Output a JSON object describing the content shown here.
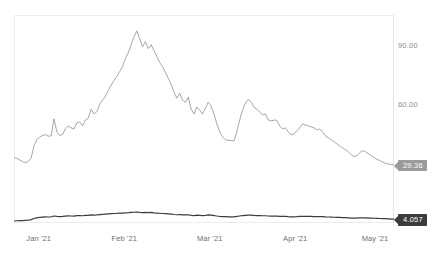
{
  "chart_data": {
    "type": "line",
    "title": "",
    "subtitle": "",
    "xlabel": "",
    "ylabel": "",
    "grid": false,
    "legend_position": "none",
    "x_tick_labels": [
      "Jan '21",
      "Feb '21",
      "Mar '21",
      "Apr '21",
      "May '21"
    ],
    "x_tick_positions_pct": [
      6.5,
      29.0,
      51.5,
      74.0,
      95.0
    ],
    "y_tick_labels": [
      "90.00",
      "60.00",
      "30.00"
    ],
    "y_tick_values": [
      90,
      60,
      30
    ],
    "ylim": [
      0,
      105
    ],
    "xlim_labels": [
      "2020-12-28",
      "2021-05-07"
    ],
    "series": [
      {
        "name": "primary-gray-series",
        "color": "#a6a6a6",
        "end_label": "29.36",
        "end_value": 29.36,
        "values": [
          33.0,
          32.6,
          31.8,
          31.0,
          30.4,
          31.2,
          32.8,
          39.0,
          42.0,
          43.5,
          44.2,
          44.6,
          43.8,
          44.0,
          52.6,
          46.0,
          44.2,
          44.8,
          47.5,
          49.0,
          48.0,
          47.4,
          50.6,
          51.0,
          49.0,
          52.0,
          53.0,
          57.5,
          55.0,
          56.2,
          60.0,
          62.0,
          64.0,
          67.0,
          69.5,
          72.0,
          74.0,
          76.5,
          79.0,
          83.0,
          86.0,
          90.0,
          94.0,
          97.0,
          93.0,
          89.0,
          91.5,
          88.0,
          90.0,
          87.0,
          84.0,
          81.0,
          79.0,
          76.0,
          73.0,
          70.0,
          66.0,
          63.0,
          65.5,
          62.0,
          61.0,
          63.5,
          57.5,
          55.0,
          58.5,
          57.0,
          55.0,
          58.0,
          61.0,
          59.0,
          55.0,
          50.0,
          46.0,
          43.5,
          42.0,
          41.8,
          41.6,
          41.5,
          46.0,
          52.0,
          57.0,
          60.5,
          62.5,
          61.0,
          58.5,
          57.5,
          56.0,
          54.5,
          55.0,
          52.0,
          51.5,
          52.0,
          51.8,
          49.0,
          47.5,
          48.0,
          46.0,
          44.5,
          45.0,
          46.5,
          48.0,
          50.0,
          49.5,
          49.0,
          48.5,
          48.0,
          47.0,
          47.5,
          46.0,
          44.0,
          43.0,
          42.0,
          41.0,
          40.0,
          39.0,
          38.0,
          37.0,
          36.0,
          34.5,
          33.5,
          34.0,
          35.5,
          36.5,
          36.0,
          35.0,
          34.0,
          33.0,
          32.2,
          31.5,
          30.8,
          30.2,
          29.8,
          29.5,
          29.36
        ]
      },
      {
        "name": "secondary-dark-series",
        "color": "#3c3c3c",
        "end_label": "4.057",
        "end_value": 4.057,
        "values": [
          3.9,
          3.92,
          3.93,
          3.94,
          3.96,
          3.98,
          4.02,
          4.12,
          4.18,
          4.22,
          4.24,
          4.26,
          4.25,
          4.27,
          4.34,
          4.3,
          4.28,
          4.3,
          4.33,
          4.35,
          4.34,
          4.33,
          4.37,
          4.38,
          4.36,
          4.39,
          4.4,
          4.44,
          4.42,
          4.43,
          4.46,
          4.48,
          4.5,
          4.52,
          4.54,
          4.56,
          4.57,
          4.59,
          4.6,
          4.62,
          4.63,
          4.65,
          4.67,
          4.69,
          4.66,
          4.64,
          4.66,
          4.63,
          4.65,
          4.62,
          4.6,
          4.58,
          4.56,
          4.54,
          4.52,
          4.5,
          4.47,
          4.45,
          4.47,
          4.44,
          4.43,
          4.45,
          4.4,
          4.38,
          4.41,
          4.4,
          4.38,
          4.4,
          4.43,
          4.41,
          4.38,
          4.34,
          4.31,
          4.29,
          4.28,
          4.27,
          4.27,
          4.27,
          4.3,
          4.34,
          4.38,
          4.4,
          4.42,
          4.41,
          4.39,
          4.38,
          4.37,
          4.36,
          4.36,
          4.34,
          4.33,
          4.34,
          4.33,
          4.31,
          4.3,
          4.3,
          4.28,
          4.27,
          4.27,
          4.28,
          4.3,
          4.31,
          4.31,
          4.3,
          4.3,
          4.29,
          4.29,
          4.29,
          4.28,
          4.26,
          4.25,
          4.24,
          4.23,
          4.22,
          4.21,
          4.2,
          4.19,
          4.18,
          4.16,
          4.15,
          4.16,
          4.17,
          4.18,
          4.17,
          4.16,
          4.15,
          4.14,
          4.13,
          4.12,
          4.11,
          4.1,
          4.09,
          4.07,
          4.057
        ]
      }
    ]
  },
  "colors": {
    "gray_line": "#a6a6a6",
    "dark_line": "#3c3c3c",
    "gray_badge": "#9b9b9b",
    "dark_badge": "#3c3c3c",
    "frame": "#ededef",
    "tick_text": "#8c8c8c",
    "background": "#ffffff"
  }
}
